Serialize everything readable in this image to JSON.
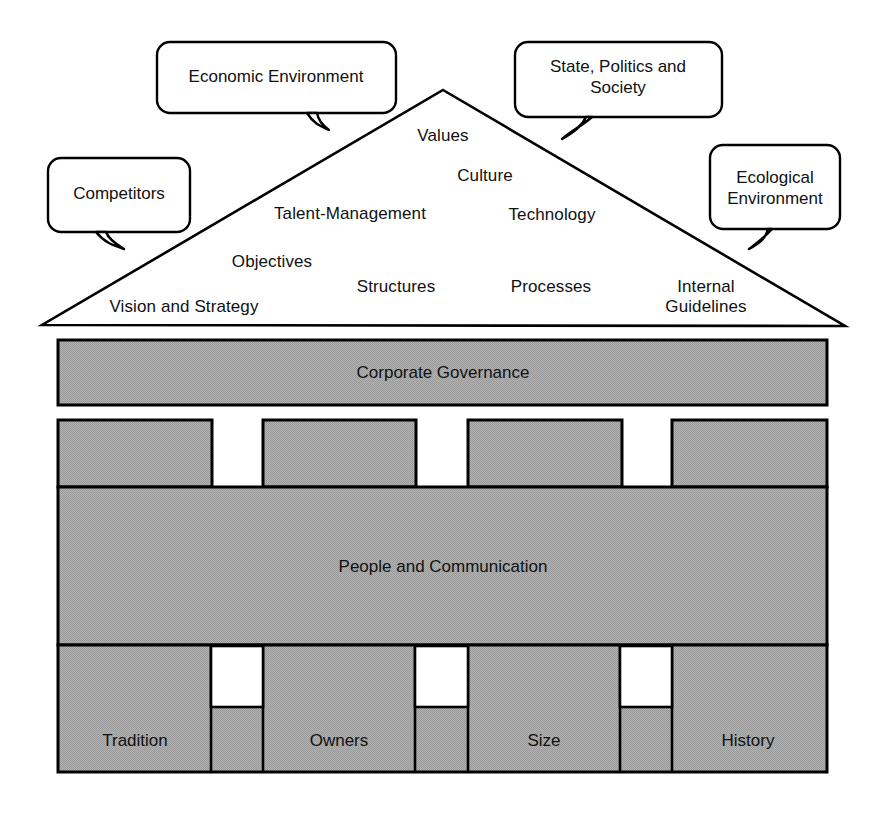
{
  "diagram": {
    "type": "house-model-diagram",
    "title_visible": false,
    "colors": {
      "fill_gray": "#a8a8a8",
      "stroke": "#000000",
      "background": "#ffffff",
      "window_white": "#ffffff"
    },
    "roof": {
      "name": "strategy-roof",
      "apex": [
        443,
        90
      ],
      "base_left": [
        42,
        325
      ],
      "base_right": [
        845,
        326
      ],
      "labels": [
        {
          "text": "Values",
          "x": 443,
          "y": 136,
          "align": "center"
        },
        {
          "text": "Culture",
          "x": 485,
          "y": 177,
          "align": "center"
        },
        {
          "text": "Talent-Management",
          "x": 350,
          "y": 215,
          "align": "center"
        },
        {
          "text": "Technology",
          "x": 552,
          "y": 216,
          "align": "center"
        },
        {
          "text": "Objectives",
          "x": 272,
          "y": 263,
          "align": "center"
        },
        {
          "text": "Structures",
          "x": 396,
          "y": 288,
          "align": "center"
        },
        {
          "text": "Processes",
          "x": 551,
          "y": 288,
          "align": "center"
        },
        {
          "text": "Internal Guidelines",
          "x": 706,
          "y": 288,
          "align": "center",
          "two_line": true
        },
        {
          "text": "Vision and Strategy",
          "x": 184,
          "y": 308,
          "align": "center"
        }
      ]
    },
    "callouts": [
      {
        "name": "callout-economic-environment",
        "text": "Economic Environment",
        "box": {
          "x": 157,
          "y": 42,
          "w": 239,
          "h": 71
        },
        "tail": "down-right"
      },
      {
        "name": "callout-competitors",
        "text": "Competitors",
        "box": {
          "x": 48,
          "y": 158,
          "w": 142,
          "h": 74
        },
        "tail": "down-right"
      },
      {
        "name": "callout-state-politics-society",
        "text": "State, Politics and Society",
        "box": {
          "x": 515,
          "y": 42,
          "w": 207,
          "h": 75
        },
        "tail": "down-left"
      },
      {
        "name": "callout-ecological-environment",
        "text": "Ecological Environment",
        "box": {
          "x": 710,
          "y": 145,
          "w": 130,
          "h": 84
        },
        "tail": "down-left"
      }
    ],
    "bands": [
      {
        "name": "band-corporate-governance",
        "label": "Corporate Governance",
        "x": 58,
        "y": 340,
        "w": 769,
        "h": 65,
        "label_x": 443,
        "label_y": 364
      },
      {
        "name": "band-people-and-communication",
        "label": "People and Communication",
        "x": 58,
        "y": 487,
        "w": 769,
        "h": 158,
        "label_x": 443,
        "label_y": 560
      }
    ],
    "pillar_row": {
      "name": "pillar-row-upper",
      "y": 420,
      "h": 67,
      "blocks": [
        {
          "x": 58,
          "w": 154
        },
        {
          "x": 263,
          "w": 153
        },
        {
          "x": 468,
          "w": 154
        },
        {
          "x": 672,
          "w": 155
        }
      ],
      "gaps": [
        {
          "x": 212,
          "w": 51
        },
        {
          "x": 416,
          "w": 52
        },
        {
          "x": 622,
          "w": 50
        }
      ]
    },
    "foundation": {
      "name": "band-foundation",
      "x": 58,
      "y": 645,
      "w": 769,
      "h": 127,
      "pillars": [
        {
          "name": "pillar-tradition",
          "label": "Tradition",
          "label_x": 147,
          "label_y": 730
        },
        {
          "name": "pillar-owners",
          "label": "Owners",
          "label_x": 351,
          "label_y": 730
        },
        {
          "name": "pillar-size",
          "label": "Size",
          "label_x": 556,
          "label_y": 730
        },
        {
          "name": "pillar-history",
          "label": "History",
          "label_x": 760,
          "label_y": 730
        }
      ],
      "windows": [
        {
          "x": 211,
          "y": 646,
          "w": 52,
          "h": 61
        },
        {
          "x": 415,
          "y": 646,
          "w": 53,
          "h": 61
        },
        {
          "x": 620,
          "y": 646,
          "w": 52,
          "h": 61
        }
      ]
    }
  }
}
